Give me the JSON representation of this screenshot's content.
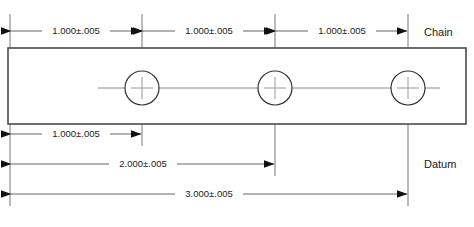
{
  "drawing": {
    "type": "engineering-dimension-drawing",
    "background_color": "#ffffff",
    "line_color": "#555555",
    "part_outline_color": "#4a4a4a",
    "text_color": "#1a1a1a",
    "arrow_color": "#111111",
    "part": {
      "name": "rectangular-plate",
      "x": 8,
      "y": 48,
      "width": 458,
      "height": 76
    },
    "holes": [
      {
        "name": "hole-1",
        "cx": 142,
        "cy": 88,
        "r": 17
      },
      {
        "name": "hole-2",
        "cx": 275,
        "cy": 88,
        "r": 17
      },
      {
        "name": "hole-3",
        "cx": 408,
        "cy": 88,
        "r": 17
      }
    ],
    "chain_dimensions": {
      "label": "Chain",
      "label_x": 424,
      "label_y": 37,
      "y": 31,
      "segments": [
        {
          "name": "chain-dim-1",
          "text": "1.000±.005",
          "x1": 10,
          "x2": 142,
          "text_x": 76
        },
        {
          "name": "chain-dim-2",
          "text": "1.000±.005",
          "x1": 142,
          "x2": 275,
          "text_x": 209
        },
        {
          "name": "chain-dim-3",
          "text": "1.000±.005",
          "x1": 275,
          "x2": 408,
          "text_x": 342
        }
      ]
    },
    "datum_dimensions": {
      "label": "Datum",
      "label_x": 424,
      "label_y": 167,
      "segments": [
        {
          "name": "datum-dim-1",
          "text": "1.000±.005",
          "x1": 10,
          "x2": 142,
          "y": 134,
          "text_x": 76
        },
        {
          "name": "datum-dim-2",
          "text": "2.000±.005",
          "x1": 10,
          "x2": 275,
          "y": 164,
          "text_x": 143
        },
        {
          "name": "datum-dim-3",
          "text": "3.000±.005",
          "x1": 10,
          "x2": 408,
          "y": 194,
          "text_x": 209
        }
      ]
    },
    "extension_lines": [
      {
        "name": "extension-line-origin",
        "x": 10,
        "y1": 14,
        "y2": 206
      },
      {
        "name": "extension-line-hole-1",
        "x": 142,
        "y1": 14,
        "y2": 146
      },
      {
        "name": "extension-line-hole-2",
        "x": 275,
        "y1": 14,
        "y2": 176
      },
      {
        "name": "extension-line-hole-3",
        "x": 408,
        "y1": 14,
        "y2": 206
      }
    ],
    "centerline": {
      "name": "horizontal-centerline",
      "y": 88,
      "x1": 98,
      "x2": 440
    }
  }
}
